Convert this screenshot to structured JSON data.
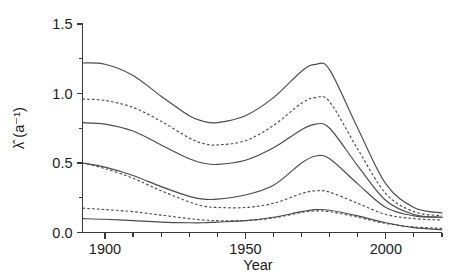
{
  "chart_data": {
    "type": "line",
    "title": "",
    "xlabel": "Year",
    "ylabel": "λ̂ (a⁻¹)",
    "xlim": [
      1892,
      2020
    ],
    "ylim": [
      0.0,
      1.5
    ],
    "grid": false,
    "legend": null,
    "x_ticks_major": [
      1900,
      1950,
      2000
    ],
    "x_tick_labels": [
      "1900",
      "1950",
      "2000"
    ],
    "x_ticks_minor": [
      1900,
      1910,
      1920,
      1930,
      1940,
      1950,
      1960,
      1970,
      1980,
      1990,
      2000,
      2010,
      2020
    ],
    "y_ticks_major": [
      0.0,
      0.5,
      1.0,
      1.5
    ],
    "y_tick_labels": [
      "0.0",
      "0.5",
      "1.0",
      "1.5"
    ],
    "y_ticks_minor": [
      0.25,
      0.75,
      1.25
    ],
    "x": [
      1892,
      1900,
      1910,
      1920,
      1930,
      1935,
      1940,
      1950,
      1960,
      1970,
      1975,
      1980,
      1990,
      2000,
      2010,
      2020
    ],
    "series": [
      {
        "name": "upper-outer-solid",
        "style": "solid",
        "values": [
          1.22,
          1.21,
          1.13,
          0.98,
          0.84,
          0.8,
          0.79,
          0.84,
          0.97,
          1.16,
          1.21,
          1.17,
          0.75,
          0.35,
          0.18,
          0.14
        ]
      },
      {
        "name": "upper-inner-dashed",
        "style": "dashed",
        "values": [
          0.96,
          0.95,
          0.9,
          0.8,
          0.68,
          0.64,
          0.63,
          0.66,
          0.77,
          0.93,
          0.97,
          0.94,
          0.6,
          0.28,
          0.15,
          0.12
        ]
      },
      {
        "name": "middle-upper-solid",
        "style": "solid",
        "values": [
          0.79,
          0.78,
          0.73,
          0.63,
          0.53,
          0.5,
          0.49,
          0.52,
          0.61,
          0.74,
          0.78,
          0.75,
          0.48,
          0.23,
          0.13,
          0.11
        ]
      },
      {
        "name": "middle-lower-solid",
        "style": "solid",
        "values": [
          0.5,
          0.47,
          0.41,
          0.33,
          0.26,
          0.24,
          0.24,
          0.27,
          0.34,
          0.5,
          0.55,
          0.53,
          0.35,
          0.18,
          0.12,
          0.11
        ]
      },
      {
        "name": "lower-dashed",
        "style": "dashed",
        "values": [
          0.5,
          0.46,
          0.39,
          0.3,
          0.22,
          0.19,
          0.18,
          0.18,
          0.21,
          0.28,
          0.3,
          0.29,
          0.21,
          0.13,
          0.1,
          0.09
        ]
      },
      {
        "name": "bottom-dashed",
        "style": "dashed",
        "values": [
          0.175,
          0.165,
          0.15,
          0.125,
          0.1,
          0.09,
          0.085,
          0.085,
          0.105,
          0.145,
          0.155,
          0.15,
          0.11,
          0.065,
          0.04,
          0.03
        ]
      },
      {
        "name": "bottom-solid",
        "style": "solid",
        "values": [
          0.1,
          0.095,
          0.085,
          0.075,
          0.07,
          0.07,
          0.075,
          0.085,
          0.11,
          0.15,
          0.165,
          0.16,
          0.12,
          0.07,
          0.035,
          0.02
        ]
      }
    ]
  },
  "axes": {
    "y_title": "λ̂ (a⁻¹)",
    "x_title": "Year",
    "y_labels": [
      "1.5",
      "1.0",
      "0.5",
      "0.0"
    ],
    "x_labels": [
      "1900",
      "1950",
      "2000"
    ]
  },
  "colors": {
    "line": "#4a4a4a",
    "axis": "#3a3a3a",
    "text": "#1a1a1a",
    "background": "#ffffff"
  }
}
